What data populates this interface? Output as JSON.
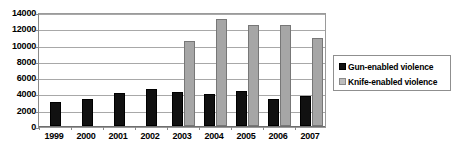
{
  "chart_data": {
    "type": "bar",
    "title": "",
    "xlabel": "",
    "ylabel": "",
    "categories": [
      "1999",
      "2000",
      "2001",
      "2002",
      "2003",
      "2004",
      "2005",
      "2006",
      "2007"
    ],
    "series": [
      {
        "name": "Gun-enabled violence",
        "color": "#111111",
        "values": [
          3000,
          3300,
          4100,
          4500,
          4150,
          3950,
          4300,
          3350,
          3700
        ]
      },
      {
        "name": "Knife-enabled violence",
        "color": "#a6a6a6",
        "values": [
          null,
          null,
          null,
          null,
          10400,
          13100,
          12400,
          12350,
          10800
        ]
      }
    ],
    "ylim": [
      0,
      14000
    ],
    "yticks": [
      0,
      2000,
      4000,
      6000,
      8000,
      10000,
      12000,
      14000
    ],
    "ytick_labels": [
      "0",
      "2000",
      "4000",
      "6000",
      "8000",
      "10000",
      "12000",
      "14000"
    ],
    "grid": true,
    "legend_position": "right"
  },
  "legend": {
    "entries": [
      {
        "label": "Gun-enabled violence",
        "swatch": "gun"
      },
      {
        "label": "Knife-enabled violence",
        "swatch": "knife"
      }
    ]
  }
}
